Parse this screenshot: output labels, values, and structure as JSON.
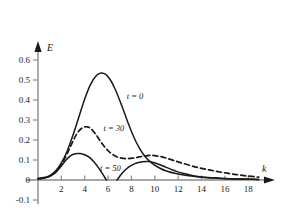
{
  "chart_data": {
    "type": "line",
    "title": "",
    "xlabel": "k",
    "ylabel": "E",
    "xlim": [
      -0.6,
      20.2
    ],
    "ylim": [
      -0.12,
      0.68
    ],
    "grid": false,
    "legend_position": "inline-annotations",
    "xticks": [
      2,
      4,
      6,
      8,
      10,
      12,
      14,
      16,
      18
    ],
    "xtick_labels": [
      "2",
      "4",
      "6",
      "8",
      "10",
      "12",
      "14",
      "16",
      "18"
    ],
    "yticks": [
      -0.1,
      0,
      0.1,
      0.2,
      0.3,
      0.4,
      0.5,
      0.6
    ],
    "ytick_labels": [
      "-0.1",
      "0",
      "0.1",
      "0.2",
      "0.3",
      "0.4",
      "0.5",
      "0.6"
    ],
    "series": [
      {
        "name": "t = 0",
        "label": "t = 0",
        "style": "solid",
        "color": "#1a1a1a",
        "label_x": 7.6,
        "label_y": 0.405,
        "x": [
          0.0,
          0.5,
          1.0,
          1.5,
          2.0,
          2.5,
          3.0,
          3.5,
          4.0,
          4.5,
          5.0,
          5.4,
          5.8,
          6.2,
          6.6,
          7.0,
          7.4,
          7.8,
          8.2,
          8.6,
          9.0,
          9.4,
          9.8,
          10.4,
          11.0,
          11.8,
          12.6,
          13.4,
          14.2,
          15.0,
          16.0,
          17.0,
          18.0,
          18.9
        ],
        "y": [
          0.008,
          0.012,
          0.022,
          0.045,
          0.085,
          0.145,
          0.225,
          0.315,
          0.405,
          0.478,
          0.522,
          0.535,
          0.528,
          0.5,
          0.455,
          0.398,
          0.335,
          0.272,
          0.215,
          0.168,
          0.13,
          0.102,
          0.082,
          0.06,
          0.045,
          0.032,
          0.024,
          0.018,
          0.013,
          0.01,
          0.007,
          0.005,
          0.004,
          0.003
        ]
      },
      {
        "name": "t = 30",
        "label": "t = 30",
        "style": "dashed",
        "color": "#1a1a1a",
        "label_x": 5.6,
        "label_y": 0.243,
        "x": [
          0.0,
          0.5,
          1.0,
          1.5,
          2.0,
          2.5,
          3.0,
          3.4,
          3.8,
          4.2,
          4.5,
          4.9,
          5.3,
          5.7,
          6.1,
          6.5,
          6.9,
          7.3,
          7.7,
          8.1,
          8.5,
          8.9,
          9.3,
          9.7,
          10.1,
          10.5,
          11.0,
          11.6,
          12.2,
          13.0,
          13.8,
          14.6,
          15.4,
          16.2,
          17.0,
          17.8,
          18.6,
          18.9
        ],
        "y": [
          0.006,
          0.01,
          0.019,
          0.04,
          0.078,
          0.132,
          0.195,
          0.238,
          0.261,
          0.266,
          0.258,
          0.232,
          0.198,
          0.166,
          0.141,
          0.124,
          0.113,
          0.108,
          0.107,
          0.109,
          0.113,
          0.118,
          0.121,
          0.123,
          0.121,
          0.117,
          0.109,
          0.098,
          0.087,
          0.073,
          0.061,
          0.051,
          0.042,
          0.034,
          0.027,
          0.021,
          0.016,
          0.014
        ]
      },
      {
        "name": "t = 50 (left lobe)",
        "label": "t = 50",
        "style": "solid",
        "color": "#1a1a1a",
        "label_x": 5.3,
        "label_y": 0.043,
        "x": [
          0.0,
          0.5,
          1.0,
          1.5,
          2.0,
          2.4,
          2.8,
          3.2,
          3.6,
          4.0,
          4.4,
          4.8,
          5.1,
          5.4,
          5.6,
          5.75,
          5.85
        ],
        "y": [
          0.005,
          0.009,
          0.018,
          0.037,
          0.07,
          0.1,
          0.122,
          0.131,
          0.132,
          0.126,
          0.113,
          0.09,
          0.068,
          0.042,
          0.024,
          0.01,
          0.0
        ]
      },
      {
        "name": "t = 50 (right lobe)",
        "label": "",
        "style": "solid",
        "color": "#1a1a1a",
        "label_x": null,
        "label_y": null,
        "x": [
          6.75,
          6.9,
          7.1,
          7.4,
          7.7,
          8.0,
          8.3,
          8.6,
          8.9,
          9.2,
          9.5,
          9.8,
          10.1,
          10.5,
          10.9,
          11.4,
          11.9,
          12.5,
          13.1,
          13.7,
          14.3,
          15.0,
          15.8,
          16.6,
          17.4,
          18.2,
          18.9
        ],
        "y": [
          0.0,
          0.01,
          0.026,
          0.046,
          0.062,
          0.073,
          0.082,
          0.088,
          0.091,
          0.093,
          0.092,
          0.089,
          0.084,
          0.075,
          0.065,
          0.053,
          0.042,
          0.032,
          0.024,
          0.018,
          0.014,
          0.011,
          0.008,
          0.006,
          0.005,
          0.004,
          0.003
        ]
      }
    ]
  },
  "axes": {
    "x_axis_label": "k",
    "y_axis_label": "E"
  }
}
